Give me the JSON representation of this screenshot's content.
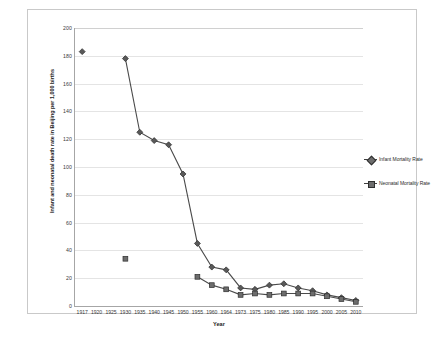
{
  "chart_data": {
    "type": "line",
    "title": "",
    "xlabel": "Year",
    "ylabel": "Infant and neonatal death rate in Beijing per 1,000 births",
    "categories": [
      "1917",
      "1920",
      "1925",
      "1930",
      "1935",
      "1940",
      "1945",
      "1950",
      "1955",
      "1960",
      "1964",
      "1973",
      "1975",
      "1980",
      "1985",
      "1990",
      "1995",
      "2000",
      "2005",
      "2010"
    ],
    "ylim": [
      0,
      200
    ],
    "yticks": [
      0,
      20,
      40,
      60,
      80,
      100,
      120,
      140,
      160,
      180,
      200
    ],
    "grid": true,
    "legend_position": "right",
    "series": [
      {
        "name": "Infant Mortality Rate",
        "marker": "diamond",
        "color": "#595959",
        "values": [
          183,
          null,
          null,
          178,
          125,
          119,
          116,
          95,
          45,
          28,
          26,
          13,
          12,
          15,
          16,
          13,
          11,
          8,
          6,
          4
        ]
      },
      {
        "name": "Neonatal Mortality Rate",
        "marker": "square",
        "color": "#6d6d6d",
        "values": [
          null,
          null,
          null,
          34,
          null,
          null,
          null,
          null,
          21,
          15,
          12,
          8,
          9,
          8,
          9,
          9,
          9,
          7,
          5,
          3
        ]
      }
    ]
  },
  "legend": {
    "items": [
      {
        "label": "Infant Mortality Rate"
      },
      {
        "label": "Neonatal Mortality Rate"
      }
    ]
  },
  "axes": {
    "y_title": "Infant and neonatal death rate in Beijing per 1,000 births",
    "x_title": "Year"
  }
}
